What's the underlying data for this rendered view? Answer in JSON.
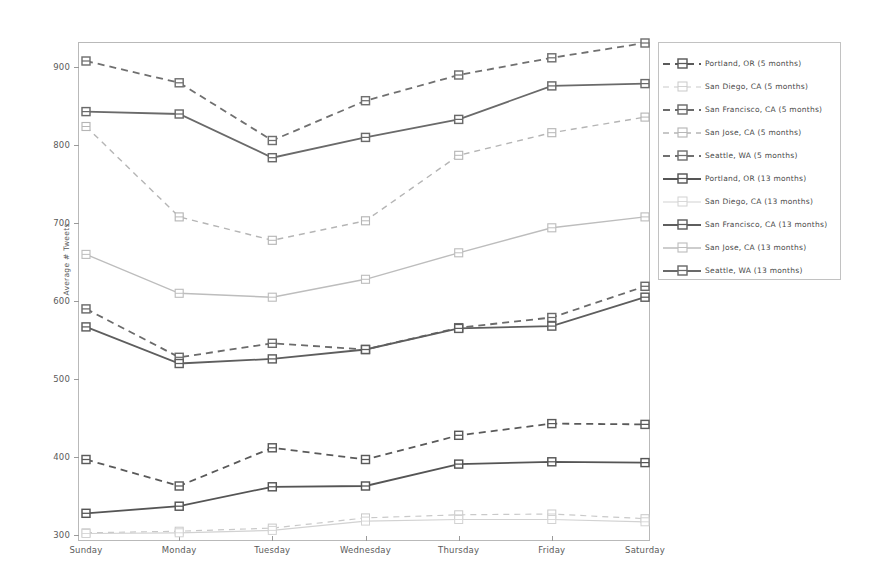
{
  "chart_data": {
    "type": "line",
    "title": "",
    "xlabel": "",
    "ylabel": "Average # Tweets",
    "categories": [
      "Sunday",
      "Monday",
      "Tuesday",
      "Wednesday",
      "Thursday",
      "Friday",
      "Saturday"
    ],
    "ylim": [
      295,
      940
    ],
    "yticks": [
      300,
      400,
      500,
      600,
      700,
      800,
      900
    ],
    "grid": false,
    "legend_position": "right-outside",
    "series": [
      {
        "name": "Portland, OR (5 months)",
        "values": [
          397,
          363,
          412,
          397,
          428,
          443,
          442
        ],
        "color": "#5a5a5a",
        "style": "dashed",
        "width": 1.8
      },
      {
        "name": "San Diego, CA (5 months)",
        "values": [
          303,
          305,
          309,
          322,
          326,
          327,
          321
        ],
        "color": "#c9c9c9",
        "style": "dashed",
        "width": 1.2
      },
      {
        "name": "San Francisco, CA (5 months)",
        "values": [
          590,
          528,
          546,
          538,
          566,
          579,
          619
        ],
        "color": "#6b6b6b",
        "style": "dashed",
        "width": 1.8
      },
      {
        "name": "San Jose, CA (5 months)",
        "values": [
          824,
          708,
          678,
          703,
          787,
          816,
          836
        ],
        "color": "#b5b5b5",
        "style": "dashed",
        "width": 1.4
      },
      {
        "name": "Seattle, WA (5 months)",
        "values": [
          908,
          880,
          806,
          857,
          890,
          912,
          931
        ],
        "color": "#707070",
        "style": "dashed",
        "width": 1.8
      },
      {
        "name": "Portland, OR (13 months)",
        "values": [
          328,
          337,
          362,
          363,
          391,
          394,
          393
        ],
        "color": "#555555",
        "style": "solid",
        "width": 1.8
      },
      {
        "name": "San Diego, CA (13 months)",
        "values": [
          302,
          303,
          306,
          318,
          320,
          320,
          317
        ],
        "color": "#d2d2d2",
        "style": "solid",
        "width": 1.2
      },
      {
        "name": "San Francisco, CA (13 months)",
        "values": [
          567,
          520,
          526,
          538,
          565,
          568,
          605
        ],
        "color": "#5e5e5e",
        "style": "solid",
        "width": 1.8
      },
      {
        "name": "San Jose, CA (13 months)",
        "values": [
          660,
          610,
          605,
          628,
          662,
          694,
          708
        ],
        "color": "#bdbdbd",
        "style": "solid",
        "width": 1.4
      },
      {
        "name": "Seattle, WA (13 months)",
        "values": [
          843,
          840,
          784,
          810,
          833,
          876,
          879
        ],
        "color": "#6a6a6a",
        "style": "solid",
        "width": 1.8
      }
    ]
  },
  "legend": {
    "items": [
      "Portland, OR (5 months)",
      "San Diego, CA (5 months)",
      "San Francisco, CA (5 months)",
      "San Jose, CA (5 months)",
      "Seattle, WA (5 months)",
      "Portland, OR (13 months)",
      "San Diego, CA (13 months)",
      "San Francisco, CA (13 months)",
      "San Jose, CA (13 months)",
      "Seattle, WA (13 months)"
    ]
  },
  "axes": {
    "y_label": "Average # Tweets",
    "y_ticks": [
      "300",
      "400",
      "500",
      "600",
      "700",
      "800",
      "900"
    ],
    "x_ticks": [
      "Sunday",
      "Monday",
      "Tuesday",
      "Wednesday",
      "Thursday",
      "Friday",
      "Saturday"
    ]
  }
}
